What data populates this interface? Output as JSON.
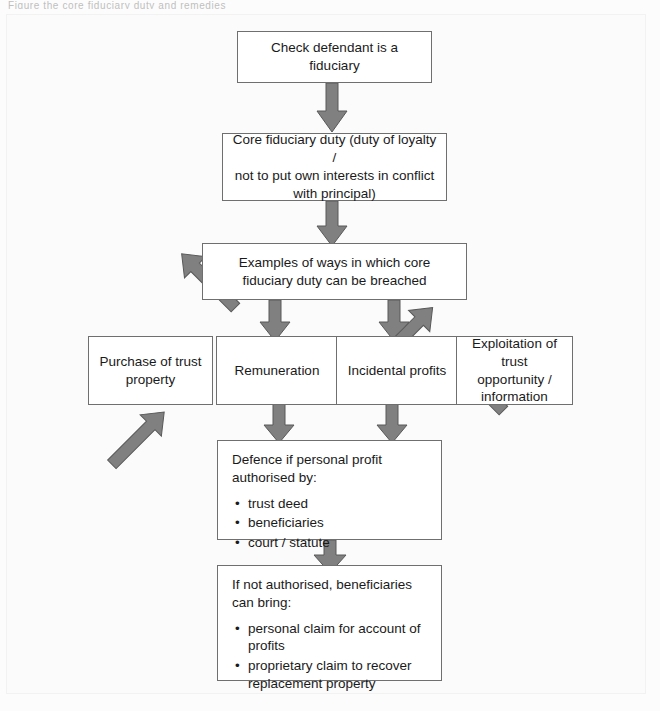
{
  "figure": {
    "type": "flowchart",
    "topic": "Breach of fiduciary duty",
    "top_sliver_text": "Figure   the core fiduciary duty and remedies",
    "colors": {
      "page_background": "#fbfbfb",
      "node_fill": "#ffffff",
      "node_border": "#6f6f6f",
      "arrow_fill": "#808080",
      "arrow_stroke": "#595959",
      "text": "#1a1a1a"
    }
  },
  "nodes": {
    "check_fiduciary": {
      "label": "Check defendant is a fiduciary"
    },
    "core_duty": {
      "line1": "Core fiduciary duty (duty of loyalty /",
      "line2": "not to put own interests in conflict",
      "line3": "with principal)"
    },
    "examples": {
      "line1": "Examples of ways in which core",
      "line2": "fiduciary duty can be breached"
    },
    "purchase": {
      "line1": "Purchase of trust",
      "line2": "property"
    },
    "remuneration": {
      "label": "Remuneration"
    },
    "incidental": {
      "label": "Incidental profits"
    },
    "exploitation": {
      "line1": "Exploitation of trust",
      "line2": "opportunity /",
      "line3": "information"
    },
    "defence": {
      "line1": "Defence if personal profit",
      "line2": "authorised by:",
      "bullets": [
        "trust deed",
        "beneficiaries",
        "court / statute"
      ]
    },
    "remedies": {
      "line1": "If not authorised, beneficiaries",
      "line2": "can bring:",
      "bullets": [
        "personal claim for account of profits",
        "proprietary claim to recover replacement property"
      ]
    }
  },
  "connectors": [
    {
      "name": "check-to-core",
      "kind": "down-arrow"
    },
    {
      "name": "core-to-examples",
      "kind": "down-arrow"
    },
    {
      "name": "examples-to-purchase",
      "kind": "diagonal-down-left-arrow"
    },
    {
      "name": "examples-to-remuneration",
      "kind": "down-arrow"
    },
    {
      "name": "examples-to-incidental",
      "kind": "down-arrow"
    },
    {
      "name": "examples-to-exploitation",
      "kind": "diagonal-down-right-arrow"
    },
    {
      "name": "purchase-to-defence",
      "kind": "diagonal-down-right-arrow"
    },
    {
      "name": "remuneration-to-defence",
      "kind": "down-arrow"
    },
    {
      "name": "incidental-to-defence",
      "kind": "down-arrow"
    },
    {
      "name": "exploitation-to-defence",
      "kind": "diagonal-down-left-arrow"
    },
    {
      "name": "defence-to-remedies",
      "kind": "down-arrow"
    }
  ]
}
